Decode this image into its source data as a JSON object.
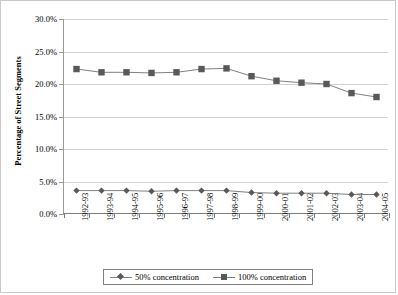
{
  "chart_data": {
    "type": "line",
    "title": "",
    "xlabel": "",
    "ylabel": "Percentage of Street Segments",
    "ylim": [
      0,
      30
    ],
    "ytick_labels": [
      "0.0%",
      "5.0%",
      "10.0%",
      "15.0%",
      "20.0%",
      "25.0%",
      "30.0%"
    ],
    "ytick_values": [
      0,
      5,
      10,
      15,
      20,
      25,
      30
    ],
    "grid": true,
    "legend_position": "bottom",
    "categories": [
      "1992-93",
      "1993-94",
      "1994-95",
      "1995-96",
      "1996-97",
      "1997-98",
      "1998-99",
      "1999-00",
      "2000-01",
      "2001-02",
      "2002-03",
      "2003-04",
      "2004-05"
    ],
    "series": [
      {
        "name": "50% concentration",
        "marker": "diamond",
        "color": "#595959",
        "values": [
          3.6,
          3.6,
          3.6,
          3.5,
          3.6,
          3.6,
          3.6,
          3.3,
          3.2,
          3.2,
          3.2,
          3.0,
          3.0
        ]
      },
      {
        "name": "100% concentration",
        "marker": "square",
        "color": "#595959",
        "values": [
          22.3,
          21.8,
          21.8,
          21.7,
          21.8,
          22.3,
          22.4,
          21.2,
          20.5,
          20.2,
          20.0,
          18.6,
          18.0
        ]
      }
    ]
  },
  "legend": {
    "items": [
      {
        "label": "50% concentration"
      },
      {
        "label": "100% concentration"
      }
    ]
  }
}
